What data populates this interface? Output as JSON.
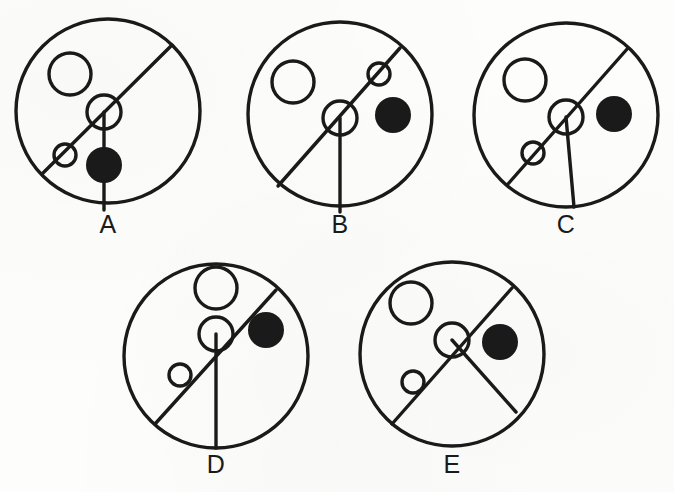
{
  "page": {
    "background_color": "#fdfdfc",
    "ink_color": "#1a1a1a",
    "width": 674,
    "height": 492
  },
  "diagram": {
    "stroke_width": 3.4,
    "labels": [
      "A",
      "B",
      "C",
      "D",
      "E"
    ],
    "figures": [
      {
        "id": "A",
        "label": "A",
        "center": [
          108,
          111
        ],
        "radius": 92,
        "label_pos": [
          108,
          226
        ],
        "outer_circle": {
          "cx": 108,
          "cy": 111,
          "r": 92
        },
        "diagonal": {
          "x1": 172,
          "y1": 45,
          "x2": 42,
          "y2": 174
        },
        "hub": {
          "cx": 104,
          "cy": 112,
          "r": 17
        },
        "bead": {
          "cx": 65,
          "cy": 155,
          "r": 11
        },
        "stem": {
          "x1": 104,
          "y1": 112,
          "x2": 104,
          "y2": 210
        },
        "open_circle": {
          "cx": 70,
          "cy": 74,
          "r": 21
        },
        "filled_circle": {
          "cx": 104,
          "cy": 165,
          "r": 18
        }
      },
      {
        "id": "B",
        "label": "B",
        "center": [
          340,
          114
        ],
        "radius": 92,
        "label_pos": [
          340,
          226
        ],
        "outer_circle": {
          "cx": 340,
          "cy": 114,
          "r": 92
        },
        "diagonal": {
          "x1": 400,
          "y1": 48,
          "x2": 278,
          "y2": 186
        },
        "hub": {
          "cx": 340,
          "cy": 118,
          "r": 17
        },
        "bead": {
          "cx": 379,
          "cy": 74,
          "r": 11
        },
        "stem": {
          "x1": 340,
          "y1": 118,
          "x2": 340,
          "y2": 212
        },
        "open_circle": {
          "cx": 293,
          "cy": 82,
          "r": 21
        },
        "filled_circle": {
          "cx": 393,
          "cy": 115,
          "r": 18
        }
      },
      {
        "id": "C",
        "label": "C",
        "center": [
          566,
          115
        ],
        "radius": 92,
        "label_pos": [
          566,
          226
        ],
        "outer_circle": {
          "cx": 566,
          "cy": 115,
          "r": 92
        },
        "diagonal": {
          "x1": 628,
          "y1": 48,
          "x2": 508,
          "y2": 184
        },
        "hub": {
          "cx": 566,
          "cy": 117,
          "r": 17
        },
        "bead": {
          "cx": 533,
          "cy": 153,
          "r": 11
        },
        "stem": {
          "x1": 566,
          "y1": 117,
          "x2": 574,
          "y2": 207
        },
        "open_circle": {
          "cx": 525,
          "cy": 80,
          "r": 21
        },
        "filled_circle": {
          "cx": 614,
          "cy": 114,
          "r": 18
        }
      },
      {
        "id": "D",
        "label": "D",
        "center": [
          216,
          356
        ],
        "radius": 92,
        "label_pos": [
          216,
          468
        ],
        "outer_circle": {
          "cx": 216,
          "cy": 356,
          "r": 92
        },
        "diagonal": {
          "x1": 276,
          "y1": 290,
          "x2": 155,
          "y2": 424
        },
        "hub": {
          "cx": 216,
          "cy": 334,
          "r": 17
        },
        "bead": {
          "cx": 180,
          "cy": 375,
          "r": 11
        },
        "stem": {
          "x1": 216,
          "y1": 334,
          "x2": 216,
          "y2": 448
        },
        "open_circle": {
          "cx": 216,
          "cy": 288,
          "r": 21
        },
        "filled_circle": {
          "cx": 266,
          "cy": 330,
          "r": 18
        }
      },
      {
        "id": "E",
        "label": "E",
        "center": [
          452,
          354
        ],
        "radius": 92,
        "label_pos": [
          452,
          468
        ],
        "outer_circle": {
          "cx": 452,
          "cy": 354,
          "r": 92
        },
        "diagonal": {
          "x1": 512,
          "y1": 288,
          "x2": 392,
          "y2": 424
        },
        "hub": {
          "cx": 452,
          "cy": 340,
          "r": 17
        },
        "bead": {
          "cx": 413,
          "cy": 382,
          "r": 11
        },
        "stem": {
          "x1": 452,
          "y1": 340,
          "x2": 516,
          "y2": 412
        },
        "open_circle": {
          "cx": 411,
          "cy": 303,
          "r": 21
        },
        "filled_circle": {
          "cx": 500,
          "cy": 342,
          "r": 18
        }
      }
    ]
  }
}
